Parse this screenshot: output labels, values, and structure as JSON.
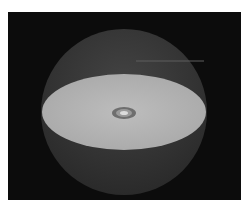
{
  "figure": {
    "colors": {
      "page_background": "#ffffff",
      "panel_background": "#0c0c0c",
      "sphere_upper": "#3a3a3a",
      "sphere_lower": "#2e2e2e",
      "disc_face": "#b4b4b4",
      "center_ring_outer": "#7a7a7a",
      "center_ring_inner": "#d8d8d8",
      "highlight_line": "#6a6a6a"
    },
    "sphere": {
      "cx": 124,
      "cy": 112,
      "r": 83
    },
    "disc": {
      "cx": 124,
      "cy": 112,
      "rx": 82,
      "ry": 38
    },
    "center_marker": {
      "cx": 124,
      "cy": 112,
      "rx": 12,
      "ry": 6
    }
  }
}
